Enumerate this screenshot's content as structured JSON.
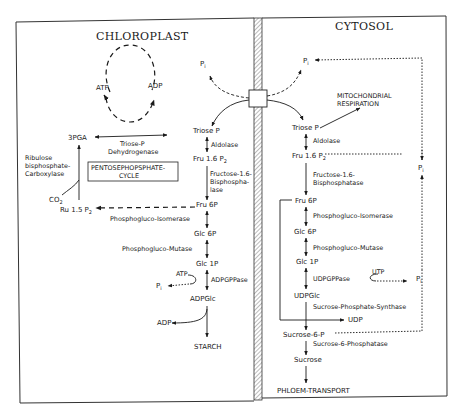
{
  "compartments": {
    "chloroplast": "CHLOROPLAST",
    "cytosol": "CYTOSOL"
  },
  "chloroplast": {
    "atp": "ATP",
    "adp": "ADP",
    "pi_top": "P",
    "pi_top_sub": "i",
    "pga": "3PGA",
    "triose_p_dh_1": "Triose-P",
    "triose_p_dh_2": "Dehydrogenase",
    "rubisco_1": "Ribulose",
    "rubisco_2": "bisphosphate-",
    "rubisco_3": "Carboxylase",
    "ppp_1": "PENTOSEPHOPSPHATE-",
    "ppp_2": "CYCLE",
    "co2": "CO",
    "co2_sub": "2",
    "rubp": "Ru 1.5 P",
    "rubp_sub": "2",
    "triose_p": "Triose P",
    "aldolase": "Aldolase",
    "fbp": "Fru 1.6 P",
    "fbp_sub": "2",
    "fbpase_1": "Fructose-1.6-",
    "fbpase_2": "Bisphospha-",
    "fbpase_3": "lase",
    "f6p": "Fru 6P",
    "pgi": "Phosphogluco-Isomerase",
    "g6p": "Glc 6P",
    "pgm": "Phosphogluco-Mutase",
    "g1p": "Glc 1P",
    "atp2": "ATP",
    "pi2": "P",
    "pi2_sub": "i",
    "adpgppase": "ADPGPPase",
    "adpglc": "ADPGlc",
    "adp2": "ADP",
    "starch": "STARCH"
  },
  "cytosol": {
    "pi_top": "P",
    "pi_top_sub": "i",
    "mito_1": "MITOCHONDRIAL",
    "mito_2": "RESPIRATION",
    "triose_p": "Triose P",
    "aldolase": "Aldolase",
    "fbp": "Fru 1.6 P",
    "fbp_sub": "2",
    "pi_right": "P",
    "pi_right_sub": "i",
    "fbpase_1": "Fructose-1.6-",
    "fbpase_2": "Bisphosphatase",
    "f6p": "Fru 6P",
    "pgi": "Phosphogluco-Isomerase",
    "g6p": "Glc 6P",
    "pgm": "Phosphogluco-Mutase",
    "g1p": "Glc 1P",
    "udpgppase": "UDPGPPase",
    "utp": "UTP",
    "pi_mid": "P",
    "pi_mid_sub": "i",
    "udpglc": "UDPGlc",
    "sps": "Sucrose-Phosphate-Synthase",
    "udp": "UDP",
    "s6p": "Sucrose-6-P",
    "s6pase": "Sucrose-6-Phosphatase",
    "sucrose": "Sucrose",
    "phloem": "PHLOEM-TRANSPORT"
  },
  "colors": {
    "ink": "#1a1a1a",
    "background": "#ffffff"
  }
}
